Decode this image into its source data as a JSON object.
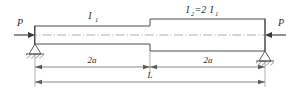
{
  "figure": {
    "labels": {
      "load_left": "P",
      "load_right": "P",
      "segment_left_symbol": "I",
      "segment_left_subscript": "1",
      "segment_right_expr_1": "I",
      "segment_right_sub_1": "2",
      "segment_right_eq": "=2",
      "segment_right_expr_2": "I",
      "segment_right_sub_2": "1",
      "dim_left": "2a",
      "dim_right": "2a",
      "dim_total": "L"
    },
    "colors": {
      "outline": "#4a4a4a",
      "centerline": "#8a8a8a",
      "dimension": "#5a5a5a",
      "load": "#3a3a3a",
      "background": "#ffffff"
    },
    "geometry": {
      "beam_left_x": 35,
      "beam_right_x": 265,
      "step_x": 150,
      "axis_y": 35,
      "left_half_depth": 9,
      "right_half_depth": 16,
      "dim_row_1_y": 67,
      "dim_row_2_y": 82
    },
    "supports": [
      {
        "name": "pin-support-left",
        "x": 35,
        "type": "pin"
      },
      {
        "name": "pin-support-right",
        "x": 265,
        "type": "pin"
      }
    ]
  }
}
